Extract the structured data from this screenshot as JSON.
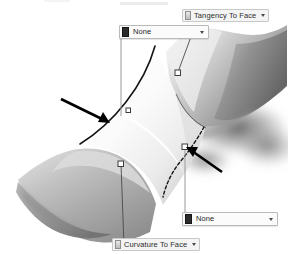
{
  "viewport": {
    "name": "surface-fill-preview",
    "background": "#ffffff",
    "surfaces": [
      {
        "name": "upper-right-saddle-surface",
        "shading": "grayscale-gradient",
        "tone_light": "#f2f2f2",
        "tone_mid": "#a8a8a8",
        "tone_dark": "#6d6d6d"
      },
      {
        "name": "lower-left-curved-surface",
        "shading": "grayscale-gradient",
        "tone_light": "#d5d5d5",
        "tone_mid": "#a3a3a3",
        "tone_dark": "#7b7b7b"
      },
      {
        "name": "center-blend-surface",
        "shading": "light-highlight",
        "tone_light": "#fdfdfd",
        "tone_mid": "#e6e6e6",
        "tone_dark": "#bfbfbf"
      }
    ],
    "edges": [
      {
        "name": "solid-boundary-edge-left",
        "style": "solid",
        "color": "#1a1a1a"
      },
      {
        "name": "dashed-boundary-edge-right",
        "style": "dashed",
        "color": "#1a1a1a"
      }
    ],
    "handles": [
      {
        "name": "handle-upper-right",
        "shape": "square",
        "fill": "#ffffff",
        "stroke": "#3c3c3c"
      },
      {
        "name": "handle-lower-left",
        "shape": "square",
        "fill": "#ffffff",
        "stroke": "#3c3c3c"
      },
      {
        "name": "handle-mid-right",
        "shape": "square",
        "fill": "#ffffff",
        "stroke": "#3c3c3c"
      },
      {
        "name": "handle-mid-left",
        "shape": "square",
        "fill": "#ffffff",
        "stroke": "#3c3c3c"
      }
    ],
    "annotation_arrows": [
      {
        "name": "annotation-arrow-left",
        "direction": "down-right",
        "color": "#000000"
      },
      {
        "name": "annotation-arrow-right",
        "direction": "up-left",
        "color": "#000000"
      }
    ],
    "leader_lines": {
      "name": "callout-leader-line",
      "color": "#9a9a9a"
    }
  },
  "callouts": {
    "tangency_tag": {
      "label": "Tangency To Face",
      "swatch_icon": "constraint-swatch-icon",
      "dropdown_icon": "chevron-down-icon"
    },
    "top_combo": {
      "value": "None",
      "placeholder": "None",
      "swatch_icon": "curvature-swatch-icon",
      "dropdown_icon": "chevron-down-icon"
    },
    "bottom_combo": {
      "value": "None",
      "placeholder": "None",
      "swatch_icon": "curvature-swatch-icon",
      "dropdown_icon": "chevron-down-icon"
    },
    "curvature_tag": {
      "label": "Curvature To Face",
      "swatch_icon": "constraint-swatch-icon",
      "dropdown_icon": "chevron-down-icon"
    }
  },
  "colors": {
    "callout_border": "#b9b9b9",
    "callout_fill": "#fbfbfb",
    "tag_fill": "#f4f4f4",
    "text": "#1f1f1f",
    "arrow": "#000000",
    "leader": "#9a9a9a"
  }
}
